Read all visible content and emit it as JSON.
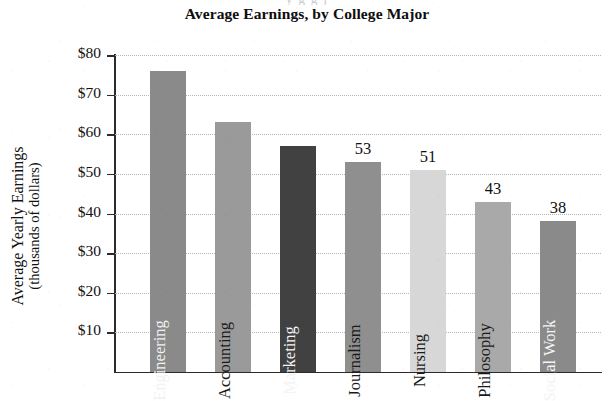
{
  "page": {
    "bleed_text_above": "y                               g                                                  g       j"
  },
  "chart_data": {
    "type": "bar",
    "title": "Average Earnings, by College Major",
    "xlabel": "",
    "ylabel": "Average Yearly Earnings",
    "ylabel_line2": "(thousands of dollars)",
    "ylim": [
      0,
      80
    ],
    "ytick_labels": [
      "$80",
      "$70",
      "$60",
      "$50",
      "$40",
      "$30",
      "$20",
      "$10"
    ],
    "ytick_values": [
      80,
      70,
      60,
      50,
      40,
      30,
      20,
      10
    ],
    "grid": true,
    "legend": "none",
    "categories": [
      "Engineering",
      "Accounting",
      "Marketing",
      "Journalism",
      "Nursing",
      "Philosophy",
      "Social Work"
    ],
    "values": [
      76,
      63,
      57,
      53,
      51,
      43,
      38
    ],
    "bars": [
      {
        "label": "Engineering",
        "value": 76,
        "value_shown": "",
        "color": "#8a8a8a",
        "label_color": "#f2f2f2"
      },
      {
        "label": "Accounting",
        "value": 63,
        "value_shown": "",
        "color": "#9a9a9a",
        "label_color": "#1a1a1a"
      },
      {
        "label": "Marketing",
        "value": 57,
        "value_shown": "",
        "color": "#414141",
        "label_color": "#f4f4f4"
      },
      {
        "label": "Journalism",
        "value": 53,
        "value_shown": "53",
        "color": "#8f8f8f",
        "label_color": "#1a1a1a"
      },
      {
        "label": "Nursing",
        "value": 51,
        "value_shown": "51",
        "color": "#d7d7d7",
        "label_color": "#1a1a1a"
      },
      {
        "label": "Philosophy",
        "value": 43,
        "value_shown": "43",
        "color": "#a9a9a9",
        "label_color": "#1a1a1a"
      },
      {
        "label": "Social Work",
        "value": 38,
        "value_shown": "38",
        "color": "#8a8a8a",
        "label_color": "#f4f4f4"
      }
    ]
  }
}
